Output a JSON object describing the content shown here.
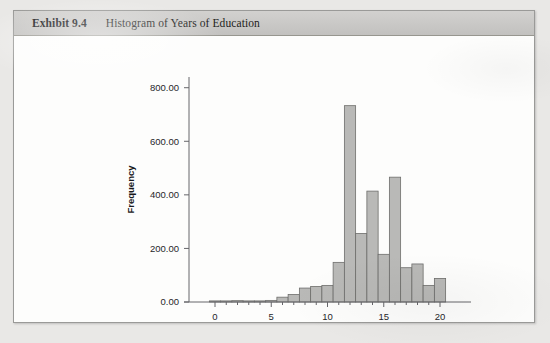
{
  "exhibit": {
    "label": "Exhibit 9.4",
    "title": "Histogram of Years of Education"
  },
  "chart_data": {
    "type": "bar",
    "title": "Histogram of Years of Education",
    "xlabel": "",
    "ylabel": "Frequency",
    "categories": [
      0,
      1,
      2,
      3,
      4,
      5,
      6,
      7,
      8,
      9,
      10,
      11,
      12,
      13,
      14,
      15,
      16,
      17,
      18,
      19,
      20
    ],
    "values": [
      4,
      3,
      5,
      4,
      3,
      6,
      18,
      28,
      52,
      58,
      62,
      148,
      733,
      256,
      414,
      178,
      466,
      128,
      142,
      62,
      88
    ],
    "x": [
      0,
      1,
      2,
      3,
      4,
      5,
      6,
      7,
      8,
      9,
      10,
      11,
      12,
      13,
      14,
      15,
      16,
      17,
      18,
      19,
      20
    ],
    "xtick_labels": [
      "0",
      "5",
      "10",
      "15",
      "20"
    ],
    "xtick_values": [
      0,
      5,
      10,
      15,
      20
    ],
    "ytick_labels": [
      "0.00",
      "200.00",
      "400.00",
      "600.00",
      "800.00"
    ],
    "ytick_values": [
      0,
      200,
      400,
      600,
      800
    ],
    "xlim": [
      -0.8,
      20.8
    ],
    "ylim": [
      0,
      840
    ],
    "grid": false,
    "legend": false,
    "bar_color": "#b9b9b7",
    "bar_edge_color": "#6e6e6c",
    "axis_color": "#66666a",
    "background": "#fdfdfc"
  }
}
